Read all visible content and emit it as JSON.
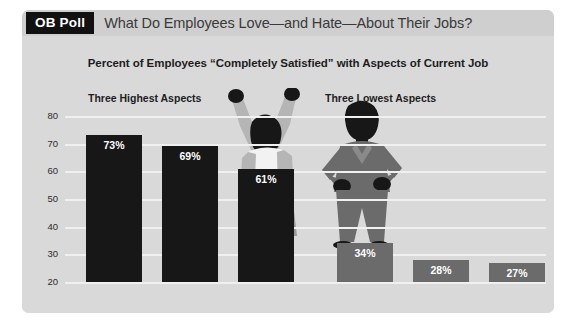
{
  "header": {
    "badge_label": "OB Poll",
    "headline": "What Do Employees Love—and Hate—About Their Jobs?"
  },
  "chart_data": {
    "type": "bar",
    "title": "Percent of Employees “Completely Satisfied” with Aspects of Current Job",
    "xlabel": "",
    "ylabel": "",
    "ylim": [
      20,
      80
    ],
    "yticks": [
      20,
      30,
      40,
      50,
      60,
      70,
      80
    ],
    "ytick_labels": [
      "20",
      "30",
      "40",
      "50",
      "60",
      "70",
      "80"
    ],
    "grid": true,
    "legend": false,
    "group_labels": [
      "Three Highest Aspects",
      "Three Lowest Aspects"
    ],
    "categories": [
      "Workplace physical conditions",
      "Coworkers",
      "Flexibility of work hours",
      "Retirement plan",
      "Pay",
      "On-the-job stress"
    ],
    "category_lines": [
      [
        "Workplace",
        "physical",
        "conditions"
      ],
      [
        "Coworkers"
      ],
      [
        "Flexibility",
        "of work",
        "hours"
      ],
      [
        "Retirement",
        "plan"
      ],
      [
        "Pay"
      ],
      [
        "On-the-job",
        "stress"
      ]
    ],
    "values": [
      73,
      69,
      61,
      34,
      28,
      27
    ],
    "data_labels": [
      "73%",
      "69%",
      "61%",
      "34%",
      "28%",
      "27%"
    ],
    "bar_colors": [
      "#171717",
      "#171717",
      "#171717",
      "#6b6b6b",
      "#6b6b6b",
      "#6b6b6b"
    ],
    "group_of_bar": [
      "highest",
      "highest",
      "highest",
      "lowest",
      "lowest",
      "lowest"
    ]
  },
  "colors": {
    "panel_background": "#d9d9d9",
    "header_background": "#cfcfcf",
    "badge_background": "#111111",
    "gridline": "#f0f0f0",
    "bar_dark": "#171717",
    "bar_light": "#6b6b6b",
    "text": "#1d1d1d",
    "figure_dark": "#171717",
    "figure_mid": "#6b6b6b",
    "figure_light": "#b5b5b5",
    "figure_white": "#f2f2f2"
  },
  "figures": {
    "celebrating": "woman-arms-raised-celebrating-silhouette",
    "frustrated": "woman-hands-on-hips-silhouette"
  }
}
